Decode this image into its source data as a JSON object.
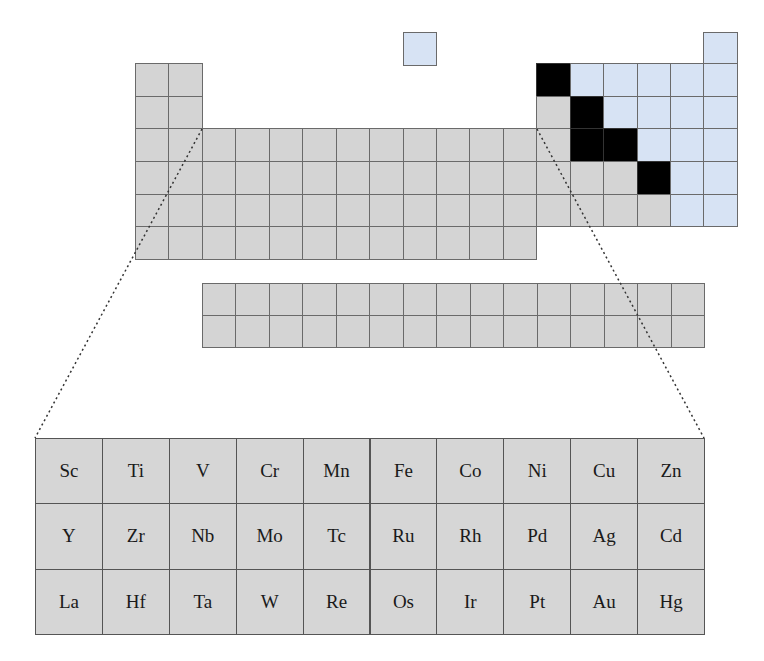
{
  "diagram": {
    "title": "",
    "colors": {
      "metal": "#d4d4d4",
      "nonmetal": "#d7e3f4",
      "metalloid": "#000000",
      "border": "#6a6a6a"
    },
    "main_table": {
      "origin": [
        135,
        63
      ],
      "cell_w": 33.44,
      "cell_h": 32.67,
      "rows": [
        {
          "period": 1,
          "cells": [
            {
              "col": 8,
              "type": "b",
              "top_offset": -31
            },
            {
              "col": 17,
              "type": "b",
              "top_offset": -31
            }
          ]
        },
        {
          "period": 2,
          "pattern": "g,g,,,,,,,,,,,k,b,b,b,b,b"
        },
        {
          "period": 3,
          "pattern": "g,g,,,,,,,,,,,g,k,b,b,b,b"
        },
        {
          "period": 4,
          "pattern": "g,g,g,g,g,g,g,g,g,g,g,g,g,k,k,b,b,b"
        },
        {
          "period": 5,
          "pattern": "g,g,g,g,g,g,g,g,g,g,g,g,g,g,g,k,b,b"
        },
        {
          "period": 6,
          "pattern": "g,g,g,g,g,g,g,g,g,g,g,g,g,g,g,g,b,b"
        },
        {
          "period": 7,
          "pattern": "g,g,g,g,g,g,g,g,g,g,g,g"
        }
      ]
    },
    "f_block": {
      "origin": [
        202,
        283
      ],
      "cols": 15,
      "rows": 2,
      "cell_w": 33.47,
      "cell_h": 32
    },
    "zoom_lines": [
      {
        "from": [
          202,
          129
        ],
        "to": [
          35,
          438
        ]
      },
      {
        "from": [
          537,
          129
        ],
        "to": [
          704,
          438
        ]
      }
    ],
    "detail_grid": {
      "origin": [
        35,
        438
      ],
      "cell_w": 66.9,
      "cell_h": 65.3,
      "rows": [
        [
          "Sc",
          "Ti",
          "V",
          "Cr",
          "Mn",
          "Fe",
          "Co",
          "Ni",
          "Cu",
          "Zn"
        ],
        [
          "Y",
          "Zr",
          "Nb",
          "Mo",
          "Tc",
          "Ru",
          "Rh",
          "Pd",
          "Ag",
          "Cd"
        ],
        [
          "La",
          "Hf",
          "Ta",
          "W",
          "Re",
          "Os",
          "Ir",
          "Pt",
          "Au",
          "Hg"
        ]
      ]
    }
  }
}
